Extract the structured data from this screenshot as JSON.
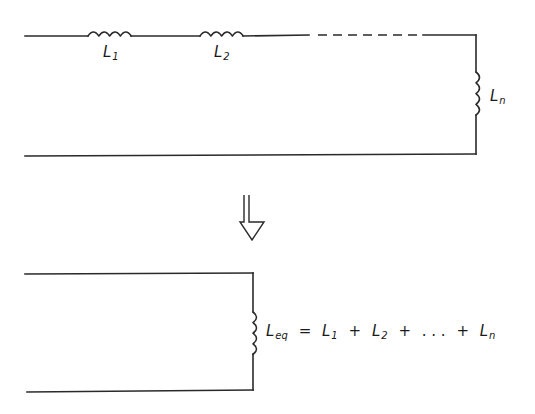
{
  "diagram": {
    "top_circuit": {
      "inductors": [
        {
          "symbol": "L",
          "subscript": "1"
        },
        {
          "symbol": "L",
          "subscript": "2"
        },
        {
          "symbol": "L",
          "subscript": "n"
        }
      ],
      "continuation": "dashed-line"
    },
    "transform_arrow": "double-line-down-arrow",
    "bottom_circuit": {
      "inductor": {
        "symbol": "L",
        "subscript": "eq"
      }
    },
    "equation": {
      "lhs": {
        "symbol": "L",
        "subscript": "eq"
      },
      "equals": "=",
      "terms": [
        {
          "symbol": "L",
          "subscript": "1"
        },
        {
          "symbol": "L",
          "subscript": "2"
        },
        {
          "symbol": ". . .",
          "subscript": ""
        },
        {
          "symbol": "L",
          "subscript": "n"
        }
      ],
      "plus": "+"
    },
    "colors": {
      "line": "#2a2a2a",
      "background": "#ffffff"
    }
  }
}
